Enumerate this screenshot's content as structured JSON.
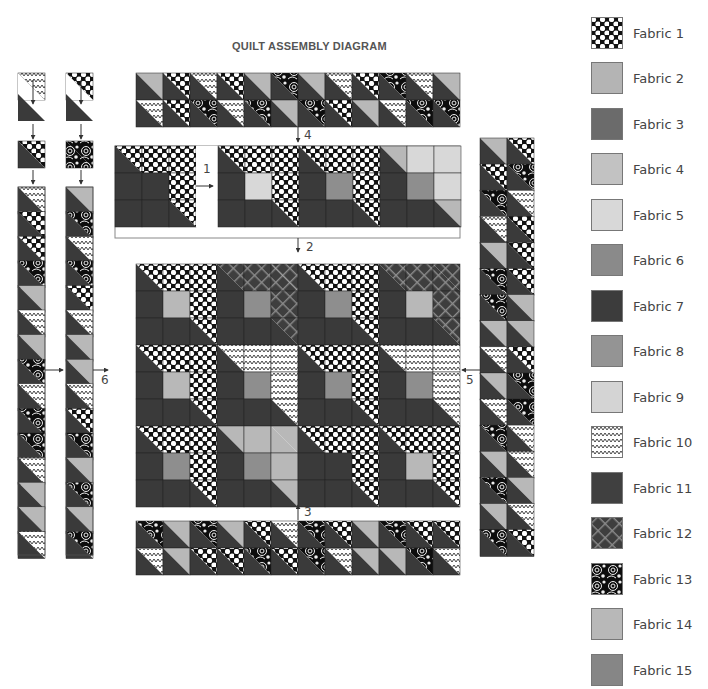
{
  "title": "QUILT ASSEMBLY DIAGRAM",
  "steps": {
    "s1": "1",
    "s2": "2",
    "s3": "3",
    "s4": "4",
    "s5": "5",
    "s6": "6"
  },
  "legend": [
    {
      "label": "Fabric 1",
      "fill": "url(#p-dots)"
    },
    {
      "label": "Fabric 2",
      "fill": "#b4b4b4"
    },
    {
      "label": "Fabric 3",
      "fill": "#6b6b6b"
    },
    {
      "label": "Fabric 4",
      "fill": "#c2c2c2"
    },
    {
      "label": "Fabric 5",
      "fill": "#d8d8d8"
    },
    {
      "label": "Fabric 6",
      "fill": "#8a8a8a"
    },
    {
      "label": "Fabric 7",
      "fill": "#3c3c3c"
    },
    {
      "label": "Fabric 8",
      "fill": "#949494"
    },
    {
      "label": "Fabric 9",
      "fill": "#d4d4d4"
    },
    {
      "label": "Fabric 10",
      "fill": "url(#p-zig)"
    },
    {
      "label": "Fabric 11",
      "fill": "#404040"
    },
    {
      "label": "Fabric 12",
      "fill": "url(#p-plaid)"
    },
    {
      "label": "Fabric 13",
      "fill": "url(#p-swirl)"
    },
    {
      "label": "Fabric 14",
      "fill": "#b8b8b8"
    },
    {
      "label": "Fabric 15",
      "fill": "#868686"
    }
  ]
}
